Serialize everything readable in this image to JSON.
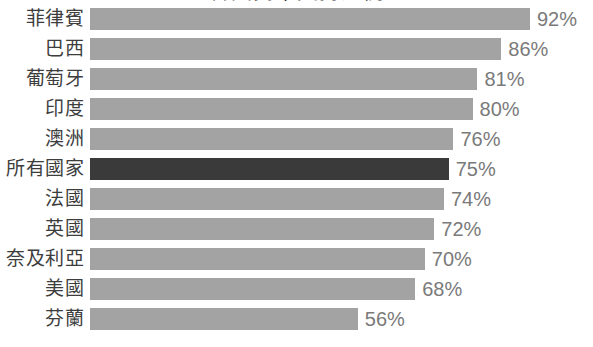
{
  "chart": {
    "title": "各國民眾支持比例",
    "value_suffix": "%"
  },
  "chart_data": {
    "type": "bar",
    "orientation": "horizontal",
    "title": "各國民眾支持比例",
    "xlabel": "",
    "ylabel": "",
    "xlim": [
      0,
      92
    ],
    "grid": false,
    "legend": null,
    "value_format": "{v}%",
    "highlight_category": "所有國家",
    "colors": {
      "bar": "#a3a3a3",
      "bar_highlight": "#3a3a3a",
      "value_label": "#7a7a7a",
      "category_label": "#3d3d3d",
      "background": "#ffffff"
    },
    "categories": [
      "菲律賓",
      "巴西",
      "葡萄牙",
      "印度",
      "澳洲",
      "所有國家",
      "法國",
      "英國",
      "奈及利亞",
      "美國",
      "芬蘭"
    ],
    "values": [
      92,
      86,
      81,
      80,
      76,
      75,
      74,
      72,
      70,
      68,
      56
    ],
    "value_labels": [
      "92%",
      "86%",
      "81%",
      "80%",
      "76%",
      "75%",
      "74%",
      "72%",
      "70%",
      "68%",
      "56%"
    ],
    "rows": [
      {
        "label": "菲律賓",
        "value": 92,
        "value_label": "92%",
        "highlight": false
      },
      {
        "label": "巴西",
        "value": 86,
        "value_label": "86%",
        "highlight": false
      },
      {
        "label": "葡萄牙",
        "value": 81,
        "value_label": "81%",
        "highlight": false
      },
      {
        "label": "印度",
        "value": 80,
        "value_label": "80%",
        "highlight": false
      },
      {
        "label": "澳洲",
        "value": 76,
        "value_label": "76%",
        "highlight": false
      },
      {
        "label": "所有國家",
        "value": 75,
        "value_label": "75%",
        "highlight": true
      },
      {
        "label": "法國",
        "value": 74,
        "value_label": "74%",
        "highlight": false
      },
      {
        "label": "英國",
        "value": 72,
        "value_label": "72%",
        "highlight": false
      },
      {
        "label": "奈及利亞",
        "value": 70,
        "value_label": "70%",
        "highlight": false
      },
      {
        "label": "美國",
        "value": 68,
        "value_label": "68%",
        "highlight": false
      },
      {
        "label": "芬蘭",
        "value": 56,
        "value_label": "56%",
        "highlight": false
      }
    ]
  }
}
